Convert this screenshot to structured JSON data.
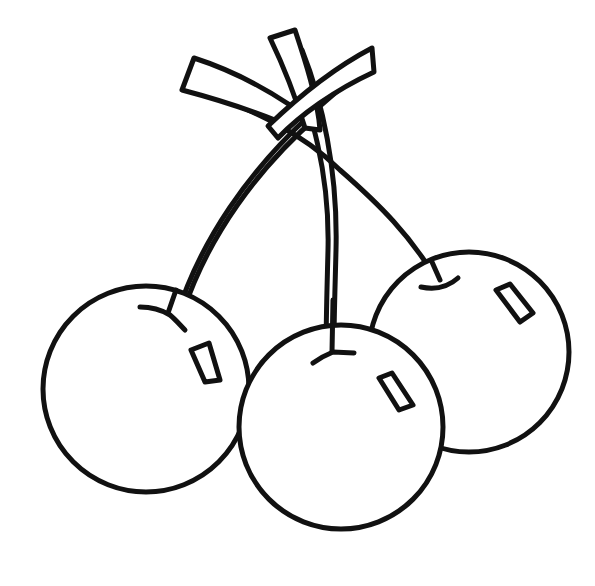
{
  "image": {
    "subject": "line drawing of three cherries with crossing stems",
    "colors": {
      "line": "#111111",
      "background": "#ffffff"
    },
    "cherries": [
      {
        "name": "left",
        "cx": 146,
        "cy": 389,
        "r": 103
      },
      {
        "name": "right",
        "cx": 469,
        "cy": 352,
        "r": 100
      },
      {
        "name": "middle",
        "cx": 341,
        "cy": 427,
        "r": 102
      }
    ]
  }
}
